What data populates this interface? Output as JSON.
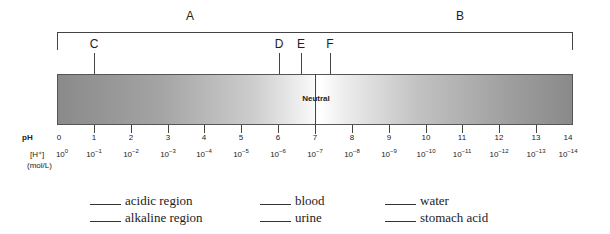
{
  "diagram": {
    "regions": [
      {
        "label": "A",
        "x": 190
      },
      {
        "label": "B",
        "x": 460
      }
    ],
    "markers": [
      {
        "label": "C",
        "x": 94
      },
      {
        "label": "D",
        "x": 279
      },
      {
        "label": "E",
        "x": 301
      },
      {
        "label": "F",
        "x": 330
      }
    ],
    "neutral_label": "Neutral",
    "ph_row_title": "pH",
    "h_row_title": "[H⁺]",
    "h_row_unit": "(mol/L)",
    "ph_values": [
      "0",
      "1",
      "2",
      "3",
      "4",
      "5",
      "6",
      "7",
      "8",
      "9",
      "10",
      "11",
      "12",
      "13",
      "14"
    ],
    "h_base": "10",
    "h_exponents": [
      "0",
      "−1",
      "−2",
      "−3",
      "−4",
      "−5",
      "−6",
      "−7",
      "−8",
      "−9",
      "−10",
      "−11",
      "−12",
      "−13",
      "−14"
    ]
  },
  "questions": {
    "col1": [
      {
        "blank": "_____",
        "text": "acidic region"
      },
      {
        "blank": "_____",
        "text": "alkaline region"
      }
    ],
    "col2": [
      {
        "blank": "_____",
        "text": "blood"
      },
      {
        "blank": "_____",
        "text": "urine"
      }
    ],
    "col3": [
      {
        "blank": "_____",
        "text": "water"
      },
      {
        "blank": "_____",
        "text": "stomach acid"
      }
    ]
  }
}
